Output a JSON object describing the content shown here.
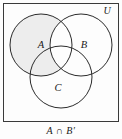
{
  "figure": {
    "type": "venn-diagram",
    "caption": "A ∩ B′",
    "universe_label": "U",
    "background_color": "#fdfdfd",
    "frame": {
      "x": 3.5,
      "y": 3.5,
      "width": 115,
      "height": 118,
      "stroke_color": "#3a3a3a",
      "stroke_width": 1
    },
    "shading": {
      "color": "#ededed",
      "description": "region inside A but outside B"
    },
    "circle_stroke_color": "#2b2b2b",
    "circle_stroke_width": 1,
    "sets": [
      {
        "id": "A",
        "label": "A",
        "cx": 41,
        "cy": 45,
        "r": 31,
        "label_x": 41,
        "label_y": 48,
        "shaded": true
      },
      {
        "id": "B",
        "label": "B",
        "cx": 81,
        "cy": 45,
        "r": 31,
        "label_x": 84,
        "label_y": 48,
        "shaded": false
      },
      {
        "id": "C",
        "label": "C",
        "cx": 61,
        "cy": 77,
        "r": 31,
        "label_x": 58,
        "label_y": 91,
        "shaded": false
      }
    ],
    "universe_label_x": 107,
    "universe_label_y": 14
  }
}
